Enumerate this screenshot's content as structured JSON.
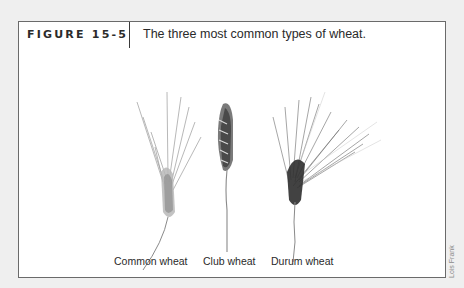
{
  "figure": {
    "label": "FIGURE 15-5",
    "caption": "The three most common types of wheat."
  },
  "plants": [
    {
      "name": "common-wheat",
      "label": "Common wheat"
    },
    {
      "name": "club-wheat",
      "label": "Club wheat"
    },
    {
      "name": "durum-wheat",
      "label": "Durum wheat"
    }
  ],
  "credit": "Lois Frank",
  "colors": {
    "page_background": "#efefef",
    "box_border": "#6a6a6a",
    "text": "#2a2a2a"
  }
}
